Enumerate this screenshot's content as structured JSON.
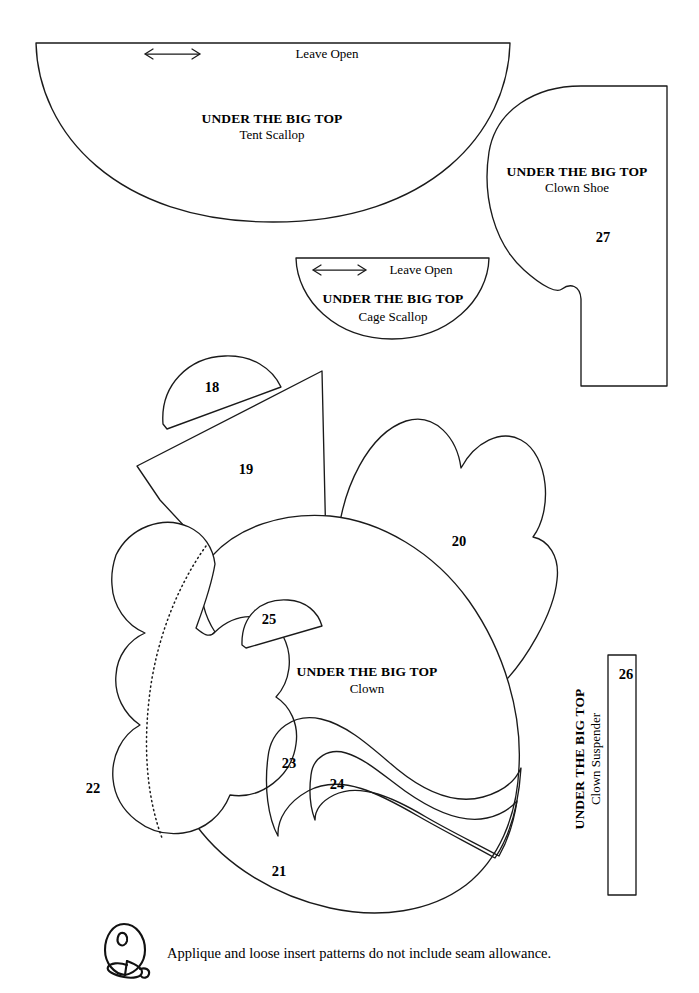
{
  "sheet": {
    "background_color": "#ffffff",
    "ink_color": "#1a1a1a",
    "brand": "UNDER THE BIG TOP"
  },
  "pieces": [
    {
      "id": "tent-scallop",
      "brand": "UNDER THE BIG TOP",
      "name": "Tent Scallop",
      "leave_open": "Leave Open",
      "has_arrow": true,
      "number": ""
    },
    {
      "id": "clown-shoe",
      "brand": "UNDER THE BIG TOP",
      "name": "Clown Shoe",
      "leave_open": "",
      "has_arrow": false,
      "number": "27"
    },
    {
      "id": "cage-scallop",
      "brand": "UNDER THE BIG TOP",
      "name": "Cage Scallop",
      "leave_open": "Leave Open",
      "has_arrow": true,
      "number": ""
    },
    {
      "id": "clown",
      "brand": "UNDER THE BIG TOP",
      "name": "Clown",
      "leave_open": "",
      "has_arrow": false,
      "number": ""
    },
    {
      "id": "clown-suspender",
      "brand": "UNDER THE BIG TOP",
      "name": "Clown Suspender",
      "leave_open": "",
      "has_arrow": false,
      "number": "26"
    }
  ],
  "piece_numbers": {
    "hat_pom": "18",
    "hat": "19",
    "hair_right": "20",
    "face": "21",
    "hair_left": "22",
    "mouth_outer": "23",
    "mouth_inner": "24",
    "nose": "25",
    "suspender": "26",
    "shoe": "27"
  },
  "footer": {
    "note": "Applique and loose insert patterns do not include seam allowance.",
    "icon": "balloon-icon"
  }
}
